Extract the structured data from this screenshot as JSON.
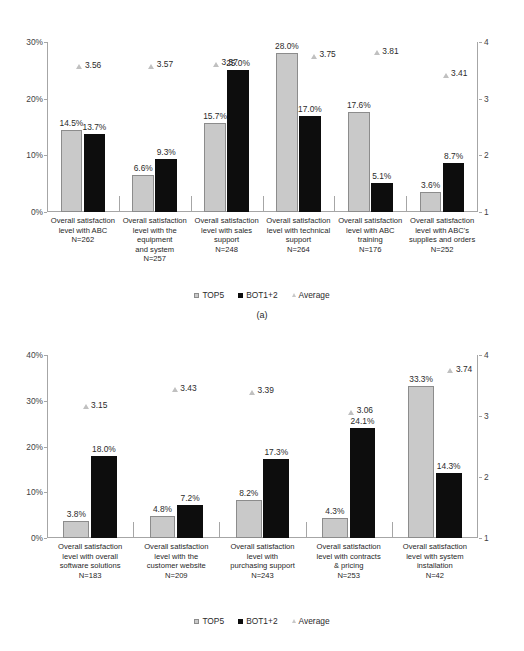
{
  "figure": {
    "panels": [
      {
        "id": "a",
        "caption": "(a)",
        "legend": [
          {
            "key": "top5",
            "label": "TOP5",
            "color": "#c9c9c9",
            "marker": "square"
          },
          {
            "key": "bot12",
            "label": "BOT1+2",
            "color": "#0d0d0d",
            "marker": "square"
          },
          {
            "key": "average",
            "label": "Average",
            "color": "#c8c8c8",
            "marker": "triangle"
          }
        ],
        "chart_data": {
          "type": "bar",
          "title": "",
          "xlabel": "",
          "ylabel": "",
          "ylim": [
            0,
            30
          ],
          "yticks": [
            "0%",
            "10%",
            "20%",
            "30%"
          ],
          "y2lim": [
            1,
            4
          ],
          "y2ticks": [
            "1",
            "2",
            "3",
            "4"
          ],
          "grid": false,
          "legend_position": "bottom",
          "categories": [
            "Overall satisfaction\nlevel with ABC\nN=262",
            "Overall satisfaction\nlevel with the\nequipment\nand system\nN=257",
            "Overall satisfaction\nlevel with sales\nsupport\nN=248",
            "Overall satisfaction\nlevel with technical\nsupport\nN=264",
            "Overall satisfaction\nlevel with ABC\ntraining\nN=176",
            "Overall satisfaction\nlevel with ABC's\nsupplies and orders\nN=252"
          ],
          "sample_sizes": [
            262,
            257,
            248,
            264,
            176,
            252
          ],
          "series": [
            {
              "name": "TOP5",
              "axis": "left",
              "values": [
                14.5,
                6.6,
                15.7,
                28.0,
                17.6,
                3.6
              ],
              "labels": [
                "14.5%",
                "6.6%",
                "15.7%",
                "28.0%",
                "17.6%",
                "3.6%"
              ]
            },
            {
              "name": "BOT1+2",
              "axis": "left",
              "values": [
                13.7,
                9.3,
                25.0,
                17.0,
                5.1,
                8.7
              ],
              "labels": [
                "13.7%",
                "9.3%",
                "25.0%",
                "17.0%",
                "5.1%",
                "8.7%"
              ]
            },
            {
              "name": "Average",
              "axis": "right",
              "type": "marker",
              "values": [
                3.56,
                3.57,
                3.61,
                3.75,
                3.81,
                3.41
              ],
              "labels": [
                "3.56",
                "3.57",
                "3.57",
                "3.75",
                "3.81",
                "3.41"
              ]
            }
          ]
        }
      },
      {
        "id": "b",
        "caption": "(b)",
        "legend": [
          {
            "key": "top5",
            "label": "TOP5",
            "color": "#c9c9c9",
            "marker": "square"
          },
          {
            "key": "bot12",
            "label": "BOT1+2",
            "color": "#0d0d0d",
            "marker": "square"
          },
          {
            "key": "average",
            "label": "Average",
            "color": "#c8c8c8",
            "marker": "triangle"
          }
        ],
        "chart_data": {
          "type": "bar",
          "title": "",
          "xlabel": "",
          "ylabel": "",
          "ylim": [
            0,
            40
          ],
          "yticks": [
            "0%",
            "10%",
            "20%",
            "30%",
            "40%"
          ],
          "y2lim": [
            1,
            4
          ],
          "y2ticks": [
            "1",
            "2",
            "3",
            "4"
          ],
          "grid": false,
          "legend_position": "bottom",
          "categories": [
            "Overall satisfaction\nlevel with overall\nsoftware solutions\nN=183",
            "Overall satisfaction\nlevel with the\ncustomer website\nN=209",
            "Overall satisfaction\nlevel with\npurchasing support\nN=243",
            "Overall satisfaction\nlevel with contracts\n& pricing\nN=253",
            "Overall satisfaction\nlevel with system\ninstallation\nN=42"
          ],
          "sample_sizes": [
            183,
            209,
            243,
            253,
            42
          ],
          "series": [
            {
              "name": "TOP5",
              "axis": "left",
              "values": [
                3.8,
                4.8,
                8.2,
                4.3,
                33.3
              ],
              "labels": [
                "3.8%",
                "4.8%",
                "8.2%",
                "4.3%",
                "33.3%"
              ]
            },
            {
              "name": "BOT1+2",
              "axis": "left",
              "values": [
                18.0,
                7.2,
                17.3,
                24.1,
                14.3
              ],
              "labels": [
                "18.0%",
                "7.2%",
                "17.3%",
                "24.1%",
                "14.3%"
              ]
            },
            {
              "name": "Average",
              "axis": "right",
              "type": "marker",
              "values": [
                3.15,
                3.43,
                3.39,
                3.06,
                3.74
              ],
              "labels": [
                "3.15",
                "3.43",
                "3.39",
                "3.06",
                "3.74"
              ]
            }
          ]
        }
      }
    ]
  }
}
